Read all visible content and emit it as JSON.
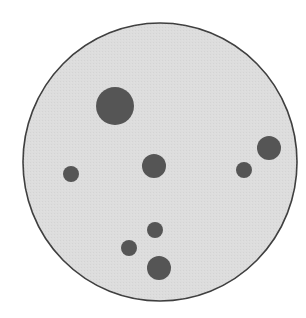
{
  "diagram": {
    "type": "dish-with-spots",
    "canvas": {
      "width": 306,
      "height": 318,
      "background": "#ffffff"
    },
    "dish": {
      "cx": 160,
      "cy": 162,
      "rx": 137,
      "ry": 139,
      "fill": "#dddddd",
      "stroke": "#3f3f3f",
      "stroke_width": 1.6
    },
    "spot_color": "#555555",
    "spots": [
      {
        "id": "spot-1",
        "cx": 115,
        "cy": 106,
        "r": 19
      },
      {
        "id": "spot-2",
        "cx": 154,
        "cy": 166,
        "r": 12
      },
      {
        "id": "spot-3",
        "cx": 71,
        "cy": 174,
        "r": 8
      },
      {
        "id": "spot-4",
        "cx": 269,
        "cy": 148,
        "r": 12
      },
      {
        "id": "spot-5",
        "cx": 244,
        "cy": 170,
        "r": 8
      },
      {
        "id": "spot-6",
        "cx": 155,
        "cy": 230,
        "r": 8
      },
      {
        "id": "spot-7",
        "cx": 129,
        "cy": 248,
        "r": 8
      },
      {
        "id": "spot-8",
        "cx": 159,
        "cy": 268,
        "r": 12
      }
    ]
  }
}
